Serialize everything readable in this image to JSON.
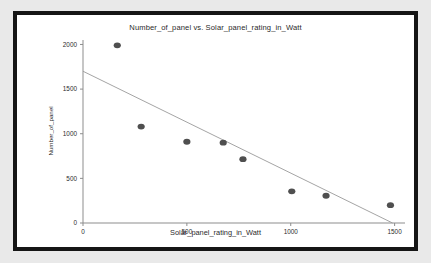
{
  "chart_data": {
    "type": "scatter",
    "title": "Number_of_panel vs. Solar_panel_rating_in_Watt",
    "xlabel": "Solar_panel_rating_in_Watt",
    "ylabel": "Number_of_panel",
    "xlim": [
      0,
      1550
    ],
    "ylim": [
      0,
      2050
    ],
    "xticks": [
      0,
      500,
      1000,
      1500
    ],
    "xticklabels": [
      "0",
      "500",
      "1000",
      "1500"
    ],
    "yticks": [
      0,
      500,
      1000,
      1500,
      2000
    ],
    "yticklabels": [
      "0",
      "500",
      "1000",
      "1500",
      "2000"
    ],
    "grid": false,
    "legend": null,
    "marker_color": "#4f4f4f",
    "trend_color": "#9a9a9a",
    "points": [
      {
        "x": 165,
        "y": 1990
      },
      {
        "x": 280,
        "y": 1080
      },
      {
        "x": 500,
        "y": 910
      },
      {
        "x": 675,
        "y": 900
      },
      {
        "x": 770,
        "y": 715
      },
      {
        "x": 1005,
        "y": 355
      },
      {
        "x": 1170,
        "y": 305
      },
      {
        "x": 1480,
        "y": 200
      }
    ],
    "series": [
      {
        "name": "observations",
        "x": [
          165,
          280,
          500,
          675,
          770,
          1005,
          1170,
          1480
        ],
        "values": [
          1990,
          1080,
          910,
          900,
          715,
          355,
          305,
          200
        ]
      },
      {
        "name": "trend-line",
        "x": [
          0,
          1490
        ],
        "values": [
          1700,
          0
        ]
      }
    ]
  }
}
